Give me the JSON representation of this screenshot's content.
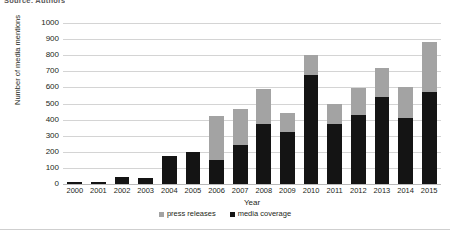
{
  "caption": {
    "source_note": "Source: Authors"
  },
  "chart_data": {
    "type": "bar",
    "stacked": true,
    "title": "",
    "xlabel": "Year",
    "ylabel": "Number of media mentions",
    "categories": [
      "2000",
      "2001",
      "2002",
      "2003",
      "2004",
      "2005",
      "2006",
      "2007",
      "2008",
      "2009",
      "2010",
      "2011",
      "2012",
      "2013",
      "2014",
      "2015"
    ],
    "series": [
      {
        "name": "media coverage",
        "color": "#141414",
        "values": [
          10,
          15,
          45,
          35,
          175,
          200,
          150,
          240,
          370,
          320,
          680,
          370,
          430,
          540,
          410,
          570
        ]
      },
      {
        "name": "press releases",
        "color": "#a3a3a3",
        "values": [
          0,
          0,
          0,
          0,
          0,
          0,
          270,
          225,
          220,
          120,
          120,
          130,
          165,
          180,
          190,
          310
        ]
      }
    ],
    "totals": [
      10,
      15,
      45,
      35,
      175,
      200,
      420,
      465,
      590,
      440,
      800,
      500,
      595,
      720,
      600,
      880
    ],
    "ylim": [
      0,
      1000
    ],
    "ytick_step": 100,
    "yticks": [
      "1000",
      "900",
      "800",
      "700",
      "600",
      "500",
      "400",
      "300",
      "200",
      "100",
      "0"
    ],
    "grid": true,
    "grid_color": "#d4d4d4",
    "legend_position": "bottom",
    "legend": [
      {
        "label": "press releases",
        "color": "#a3a3a3",
        "marker": "square-swatch"
      },
      {
        "label": "media coverage",
        "color": "#141414",
        "marker": "square-swatch"
      }
    ]
  }
}
